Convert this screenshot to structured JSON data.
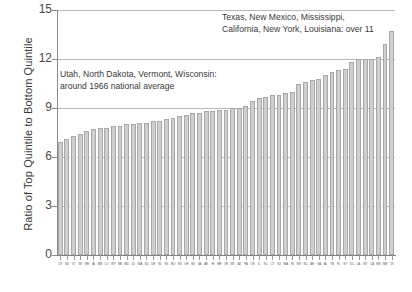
{
  "chart_data": {
    "type": "bar",
    "title": "",
    "subtitle": "",
    "xlabel": "",
    "ylabel": "Ratio of Top Quintile to Bottom Quintile",
    "ylim": [
      0,
      15
    ],
    "yticks": [
      0,
      3,
      6,
      9,
      12,
      15
    ],
    "grid": "horizontal",
    "legend": "none",
    "bar_color": "#cfcfcf",
    "bar_edge_color": "#a8a8a8",
    "categories": [
      "UT",
      "ND",
      "VT",
      "WI",
      "NH",
      "IA",
      "MN",
      "CO",
      "WY",
      "NE",
      "MD",
      "ID",
      "WA",
      "SD",
      "DE",
      "IN",
      "KS",
      "MO",
      "NV",
      "OH",
      "MI",
      "VA",
      "AK",
      "HI",
      "ME",
      "OR",
      "MT",
      "AZ",
      "PA",
      "OK",
      "IL",
      "SC",
      "CT",
      "NJ",
      "MA",
      "RI",
      "WV",
      "NC",
      "AR",
      "GA",
      "AL",
      "TN",
      "FL",
      "KY",
      "DC",
      "LA",
      "NY",
      "CA",
      "MS",
      "NM",
      "TX"
    ],
    "values": [
      6.9,
      7.1,
      7.3,
      7.4,
      7.6,
      7.7,
      7.8,
      7.8,
      7.9,
      7.9,
      8.0,
      8.0,
      8.1,
      8.1,
      8.2,
      8.2,
      8.3,
      8.4,
      8.5,
      8.6,
      8.7,
      8.7,
      8.8,
      8.8,
      8.9,
      8.9,
      9.0,
      9.0,
      9.1,
      9.4,
      9.6,
      9.7,
      9.8,
      9.8,
      9.9,
      10.0,
      10.5,
      10.6,
      10.7,
      10.8,
      11.0,
      11.2,
      11.3,
      11.4,
      11.8,
      12.0,
      12.0,
      12.0,
      12.1,
      12.9,
      13.7
    ],
    "annotations": [
      {
        "id": "over-eleven",
        "text": "Texas, New Mexico, Mississippi,\nCalifornia, New York, Louisiana: over 11"
      },
      {
        "id": "national-average",
        "text": "Utah, North Dakota, Vermont, Wisconsin:\naround 1966 national average"
      }
    ]
  }
}
